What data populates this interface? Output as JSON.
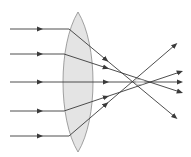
{
  "diagram": {
    "title": "Convex lens refracting parallel light rays",
    "colors": {
      "background": "#ffffff",
      "lens_fill": "#e4e4e4",
      "lens_stroke": "#8a8a8a",
      "ray": "#3a3a3a"
    },
    "lens": {
      "type": "biconvex",
      "cx": 78,
      "top": 12,
      "bottom": 152,
      "left": 62,
      "right": 96
    },
    "rays": [
      {
        "incident_y": 29,
        "enter": [
          69,
          29
        ],
        "exit_to": [
          175,
          117
        ]
      },
      {
        "incident_y": 54,
        "enter": [
          64,
          54
        ],
        "exit_to": [
          180,
          92
        ]
      },
      {
        "incident_y": 82,
        "enter": [
          62,
          82
        ],
        "exit_to": [
          180,
          82
        ]
      },
      {
        "incident_y": 111,
        "enter": [
          64,
          111
        ],
        "exit_to": [
          180,
          72
        ]
      },
      {
        "incident_y": 136,
        "enter": [
          69,
          136
        ],
        "exit_to": [
          175,
          45
        ]
      }
    ],
    "focal_region": {
      "x": 140,
      "y": 82
    }
  }
}
